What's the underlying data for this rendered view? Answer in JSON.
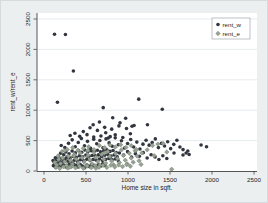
{
  "chart_data": {
    "type": "scatter",
    "title": "",
    "xlabel": "Home size in sqft.",
    "ylabel": "rent_w/rent_e",
    "xlim": [
      0,
      2500
    ],
    "ylim": [
      0,
      2500
    ],
    "x_ticks": [
      0,
      500,
      1000,
      1500,
      2000,
      2500
    ],
    "y_ticks": [
      0,
      500,
      1000,
      1500,
      2000,
      2500
    ],
    "grid": "horizontal",
    "legend_position": "top-right-inside",
    "colors": {
      "background_outer": "#eceff0",
      "background_plot": "#ffffff",
      "gridline": "#dbe4e8",
      "series_rent_w": "#32363e",
      "series_rent_e": "#97a294"
    },
    "series": [
      {
        "name": "rent_w",
        "marker": "circle",
        "color": "#32363e",
        "points": [
          [
            125,
            2250
          ],
          [
            255,
            2245
          ],
          [
            350,
            1645
          ],
          [
            160,
            1130
          ],
          [
            1128,
            1182
          ],
          [
            705,
            1042
          ],
          [
            1408,
            1015
          ],
          [
            818,
            875
          ],
          [
            972,
            868
          ],
          [
            1232,
            760
          ],
          [
            905,
            792
          ],
          [
            660,
            805
          ],
          [
            1048,
            735
          ],
          [
            585,
            760
          ],
          [
            312,
            585
          ],
          [
            368,
            622
          ],
          [
            425,
            570
          ],
          [
            468,
            648
          ],
          [
            512,
            598
          ],
          [
            548,
            712
          ],
          [
            592,
            560
          ],
          [
            636,
            668
          ],
          [
            678,
            575
          ],
          [
            722,
            718
          ],
          [
            764,
            542
          ],
          [
            806,
            688
          ],
          [
            848,
            595
          ],
          [
            892,
            742
          ],
          [
            938,
            552
          ],
          [
            982,
            698
          ],
          [
            1028,
            612
          ],
          [
            1072,
            748
          ],
          [
            735,
            628
          ],
          [
            788,
            565
          ],
          [
            205,
            420
          ],
          [
            248,
            385
          ],
          [
            292,
            455
          ],
          [
            335,
            512
          ],
          [
            372,
            398
          ],
          [
            408,
            468
          ],
          [
            445,
            535
          ],
          [
            482,
            415
          ],
          [
            518,
            488
          ],
          [
            555,
            372
          ],
          [
            592,
            522
          ],
          [
            628,
            448
          ],
          [
            665,
            502
          ],
          [
            702,
            382
          ],
          [
            738,
            528
          ],
          [
            775,
            462
          ],
          [
            812,
            408
          ],
          [
            848,
            545
          ],
          [
            885,
            432
          ],
          [
            922,
            498
          ],
          [
            958,
            378
          ],
          [
            995,
            452
          ],
          [
            1032,
            518
          ],
          [
            1068,
            395
          ],
          [
            1105,
            475
          ],
          [
            1142,
            362
          ],
          [
            1178,
            442
          ],
          [
            1215,
            505
          ],
          [
            1252,
            425
          ],
          [
            1288,
            468
          ],
          [
            1325,
            528
          ],
          [
            1362,
            385
          ],
          [
            1398,
            455
          ],
          [
            1435,
            412
          ],
          [
            1472,
            482
          ],
          [
            1508,
            368
          ],
          [
            1545,
            438
          ],
          [
            1582,
            505
          ],
          [
            1618,
            395
          ],
          [
            1655,
            352
          ],
          [
            1692,
            295
          ],
          [
            1728,
            272
          ],
          [
            1870,
            428
          ],
          [
            1935,
            398
          ],
          [
            108,
            172
          ],
          [
            122,
            145
          ],
          [
            135,
            218
          ],
          [
            148,
            188
          ],
          [
            160,
            132
          ],
          [
            172,
            242
          ],
          [
            185,
            165
          ],
          [
            198,
            292
          ],
          [
            210,
            205
          ],
          [
            222,
            152
          ],
          [
            235,
            268
          ],
          [
            248,
            192
          ],
          [
            260,
            312
          ],
          [
            272,
            228
          ],
          [
            285,
            162
          ],
          [
            298,
            282
          ],
          [
            310,
            215
          ],
          [
            322,
            148
          ],
          [
            335,
            328
          ],
          [
            348,
            238
          ],
          [
            360,
            178
          ],
          [
            372,
            298
          ],
          [
            385,
            225
          ],
          [
            398,
            158
          ],
          [
            410,
            338
          ],
          [
            422,
            252
          ],
          [
            435,
            185
          ],
          [
            448,
            308
          ],
          [
            460,
            232
          ],
          [
            472,
            168
          ],
          [
            485,
            345
          ],
          [
            498,
            262
          ],
          [
            510,
            195
          ],
          [
            522,
            318
          ],
          [
            535,
            242
          ],
          [
            548,
            175
          ],
          [
            560,
            335
          ],
          [
            572,
            255
          ],
          [
            585,
            188
          ],
          [
            598,
            325
          ],
          [
            610,
            248
          ],
          [
            622,
            178
          ],
          [
            635,
            342
          ],
          [
            648,
            265
          ],
          [
            660,
            198
          ],
          [
            672,
            315
          ],
          [
            685,
            238
          ],
          [
            698,
            172
          ],
          [
            710,
            332
          ],
          [
            722,
            258
          ],
          [
            735,
            192
          ],
          [
            748,
            348
          ],
          [
            760,
            272
          ],
          [
            772,
            205
          ],
          [
            785,
            322
          ],
          [
            798,
            245
          ],
          [
            810,
            185
          ],
          [
            822,
            338
          ],
          [
            835,
            262
          ],
          [
            848,
            198
          ],
          [
            860,
            305
          ],
          [
            872,
            232
          ],
          [
            885,
            168
          ],
          [
            898,
            295
          ],
          [
            112,
            88
          ],
          [
            138,
            62
          ],
          [
            165,
            102
          ],
          [
            192,
            75
          ],
          [
            218,
            112
          ],
          [
            245,
            85
          ],
          [
            272,
            58
          ],
          [
            298,
            105
          ],
          [
            325,
            78
          ],
          [
            352,
            115
          ],
          [
            378,
            92
          ],
          [
            405,
            65
          ],
          [
            432,
            108
          ],
          [
            458,
            82
          ],
          [
            485,
            55
          ],
          [
            512,
            98
          ],
          [
            538,
            72
          ],
          [
            565,
            112
          ],
          [
            592,
            88
          ],
          [
            618,
            60
          ],
          [
            645,
            102
          ],
          [
            672,
            78
          ],
          [
            698,
            118
          ],
          [
            725,
            95
          ],
          [
            948,
            262
          ],
          [
            995,
            318
          ],
          [
            1042,
            228
          ],
          [
            1088,
            285
          ],
          [
            1135,
            242
          ],
          [
            1182,
            302
          ],
          [
            1228,
            215
          ],
          [
            1275,
            268
          ],
          [
            1322,
            232
          ],
          [
            1368,
            188
          ],
          [
            1415,
            252
          ],
          [
            1462,
            205
          ],
          [
            1548,
            295
          ],
          [
            1655,
            262
          ],
          [
            1712,
            328
          ]
        ]
      },
      {
        "name": "rent_e",
        "marker": "diamond",
        "color": "#97a294",
        "stroke": "#6f7c6b",
        "points": [
          [
            128,
            142
          ],
          [
            152,
            98
          ],
          [
            175,
            188
          ],
          [
            198,
            122
          ],
          [
            222,
            215
          ],
          [
            245,
            152
          ],
          [
            268,
            92
          ],
          [
            292,
            242
          ],
          [
            315,
            172
          ],
          [
            338,
            112
          ],
          [
            362,
            272
          ],
          [
            385,
            195
          ],
          [
            408,
            132
          ],
          [
            432,
            295
          ],
          [
            455,
            218
          ],
          [
            478,
            148
          ],
          [
            502,
            88
          ],
          [
            525,
            258
          ],
          [
            548,
            182
          ],
          [
            572,
            118
          ],
          [
            595,
            305
          ],
          [
            618,
            225
          ],
          [
            642,
            155
          ],
          [
            665,
            95
          ],
          [
            688,
            272
          ],
          [
            712,
            192
          ],
          [
            735,
            128
          ],
          [
            758,
            318
          ],
          [
            782,
            238
          ],
          [
            805,
            165
          ],
          [
            828,
            102
          ],
          [
            852,
            288
          ],
          [
            875,
            205
          ],
          [
            898,
            138
          ],
          [
            922,
            348
          ],
          [
            945,
            255
          ],
          [
            968,
            178
          ],
          [
            992,
            115
          ],
          [
            1015,
            292
          ],
          [
            1038,
            212
          ],
          [
            1062,
            145
          ],
          [
            1085,
            332
          ],
          [
            1108,
            245
          ],
          [
            1132,
            168
          ],
          [
            1155,
            108
          ],
          [
            142,
            58
          ],
          [
            188,
            42
          ],
          [
            235,
            68
          ],
          [
            282,
            48
          ],
          [
            328,
            72
          ],
          [
            375,
            52
          ],
          [
            422,
            78
          ],
          [
            468,
            45
          ],
          [
            515,
            82
          ],
          [
            562,
            55
          ],
          [
            608,
            88
          ],
          [
            655,
            62
          ],
          [
            702,
            92
          ],
          [
            748,
            58
          ],
          [
            795,
            95
          ],
          [
            842,
            65
          ],
          [
            888,
            98
          ],
          [
            935,
            72
          ],
          [
            982,
            105
          ],
          [
            1028,
            78
          ],
          [
            215,
            322
          ],
          [
            278,
            352
          ],
          [
            342,
            385
          ],
          [
            405,
            342
          ],
          [
            468,
            372
          ],
          [
            532,
            398
          ],
          [
            595,
            352
          ],
          [
            658,
            418
          ],
          [
            722,
            385
          ],
          [
            785,
            428
          ],
          [
            848,
            395
          ],
          [
            912,
            432
          ],
          [
            975,
            388
          ],
          [
            1038,
            418
          ],
          [
            1102,
            352
          ],
          [
            1165,
            298
          ],
          [
            1228,
            348
          ],
          [
            1292,
            418
          ],
          [
            1355,
            442
          ],
          [
            1418,
            452
          ],
          [
            1520,
            28
          ],
          [
            1462,
            312
          ],
          [
            1312,
            252
          ],
          [
            248,
            335
          ],
          [
            168,
            248
          ],
          [
            308,
            62
          ],
          [
            355,
            248
          ],
          [
            520,
            335
          ],
          [
            618,
            45
          ],
          [
            718,
            295
          ]
        ]
      }
    ]
  }
}
